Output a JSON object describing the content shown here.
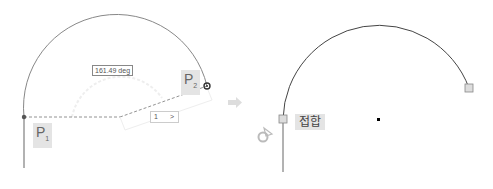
{
  "left_panel": {
    "angle_label": "161.49 deg",
    "input_value": "1",
    "input_arrow": ">",
    "point1": {
      "letter": "P",
      "index": "1"
    },
    "point2": {
      "letter": "P",
      "index": "2"
    }
  },
  "arrow": {
    "icon": "right-arrow-icon"
  },
  "right_panel": {
    "tag_label": "접합",
    "icon": "rotate-cursor-icon"
  },
  "colors": {
    "arc_left": "#888888",
    "arc_right": "#444444",
    "dashed": "#777777",
    "label_bg": "#e4e4e4"
  }
}
